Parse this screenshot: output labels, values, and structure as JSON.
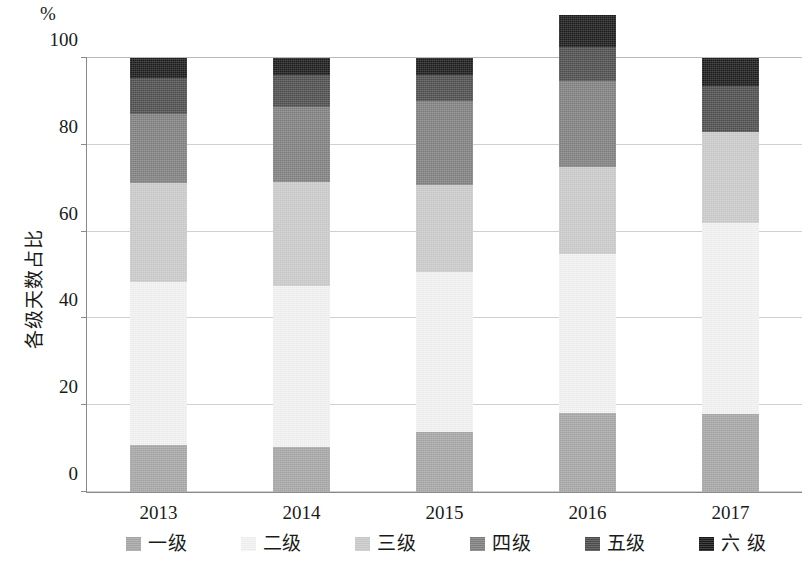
{
  "chart_data": {
    "type": "bar",
    "subtype": "stacked-bar-100-percent",
    "title": "",
    "unit_label": "%",
    "xlabel": "",
    "ylabel": "各级天数占比",
    "categories": [
      "2013",
      "2014",
      "2015",
      "2016",
      "2017"
    ],
    "ylim": [
      0,
      100
    ],
    "yticks": [
      0,
      20,
      40,
      60,
      80,
      100
    ],
    "grid": true,
    "legend_position": "bottom",
    "series": [
      {
        "name": "一级",
        "color": "#a6a6a6",
        "values": [
          10.8,
          10.3,
          13.8,
          18.2,
          18.0
        ]
      },
      {
        "name": "二级",
        "color": "#f2f2f2",
        "values": [
          37.6,
          37.2,
          36.9,
          36.6,
          44.0
        ]
      },
      {
        "name": "三级",
        "color": "#cacaca",
        "values": [
          22.8,
          24.0,
          20.0,
          20.2,
          21.0
        ]
      },
      {
        "name": "四级",
        "color": "#808080",
        "values": [
          15.8,
          17.2,
          19.3,
          19.8,
          0.0
        ]
      },
      {
        "name": "五级",
        "color": "#4d4d4d",
        "values": [
          8.3,
          7.3,
          6.0,
          7.8,
          10.5
        ]
      },
      {
        "name": "六级",
        "color": "#1a1a1a",
        "values": [
          4.7,
          4.0,
          4.0,
          7.4,
          6.5
        ]
      }
    ]
  },
  "axis": {
    "unit": "%",
    "y_title": "各级天数占比",
    "y_tick_labels": [
      "0",
      "20",
      "40",
      "60",
      "80",
      "100"
    ],
    "x_tick_labels": [
      "2013",
      "2014",
      "2015",
      "2016",
      "2017"
    ]
  },
  "legend": {
    "items": [
      {
        "label": "一级",
        "color": "#a6a6a6"
      },
      {
        "label": "二级",
        "color": "#f2f2f2"
      },
      {
        "label": "三级",
        "color": "#cacaca"
      },
      {
        "label": "四级",
        "color": "#808080"
      },
      {
        "label": "五级",
        "color": "#4d4d4d"
      },
      {
        "label": "六 级",
        "color": "#1a1a1a"
      }
    ]
  }
}
